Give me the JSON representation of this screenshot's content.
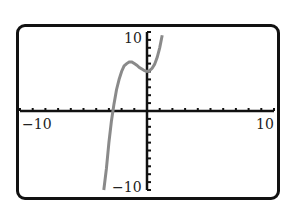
{
  "chart_data": {
    "type": "line",
    "title": "",
    "xlabel": "",
    "ylabel": "",
    "xlim": [
      -10,
      10
    ],
    "ylim": [
      -10,
      10
    ],
    "xticks_step": 1,
    "yticks_step": 1,
    "grid": false,
    "legend": null,
    "tick_labels": {
      "x_min": "−10",
      "x_max": "10",
      "y_max": "10",
      "y_min": "−10"
    },
    "series": [
      {
        "name": "f(x)",
        "color": "#8a8a8a",
        "x": [
          -3.4,
          -3.2,
          -3.0,
          -2.8,
          -2.6,
          -2.4,
          -2.2,
          -2.0,
          -1.8,
          -1.6,
          -1.4,
          -1.2,
          -1.0,
          -0.8,
          -0.6,
          -0.4,
          -0.2,
          0.0,
          0.2,
          0.4,
          0.6,
          0.8,
          1.0,
          1.2
        ],
        "y": [
          -11.2,
          -7.3,
          -4.0,
          -1.3,
          0.9,
          2.7,
          4.0,
          5.0,
          5.7,
          6.0,
          6.2,
          6.2,
          6.0,
          5.8,
          5.5,
          5.3,
          5.1,
          5.0,
          5.1,
          5.4,
          5.9,
          6.8,
          8.0,
          9.6
        ]
      }
    ],
    "window": {
      "xmin": -10,
      "xmax": 10,
      "ymin": -10,
      "ymax": 10,
      "xscl": 1,
      "yscl": 1
    }
  },
  "screen": {
    "border_color": "#111111",
    "axis_color": "#111111",
    "curve_color": "#8a8a8a"
  }
}
